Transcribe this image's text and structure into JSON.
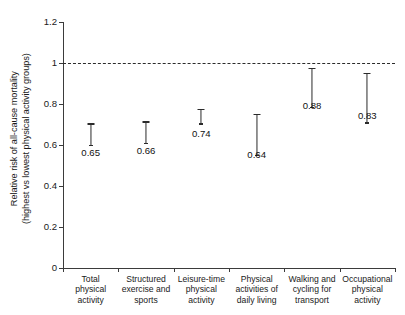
{
  "chart_data": {
    "type": "bar",
    "title": "",
    "xlabel": "",
    "ylabel_line1": "Relative risk of all-cause mortality",
    "ylabel_line2": "(highest vs lowest physical activity groups)",
    "ylim": [
      0,
      1.2
    ],
    "yticks": [
      "0",
      "0.2",
      "0.4",
      "0.6",
      "0.8",
      "1",
      "1.2"
    ],
    "ytick_values": [
      0,
      0.2,
      0.4,
      0.6,
      0.8,
      1,
      1.2
    ],
    "grid": false,
    "legend": "none",
    "reference_line": {
      "value": 1.0,
      "style": "dashed",
      "label": ""
    },
    "categories": [
      "Total physical activity",
      "Structured exercise and sports",
      "Leisure-time physical activity",
      "Physical activities of daily living",
      "Walking and cycling for transport",
      "Occupational physical activity"
    ],
    "category_lines": [
      [
        "Total",
        "physical",
        "activity"
      ],
      [
        "Structured",
        "exercise and",
        "sports"
      ],
      [
        "Leisure-time",
        "physical",
        "activity"
      ],
      [
        "Physical",
        "activities of",
        "daily living"
      ],
      [
        "Walking and",
        "cycling for",
        "transport"
      ],
      [
        "Occupational",
        "physical",
        "activity"
      ]
    ],
    "values": [
      0.65,
      0.66,
      0.74,
      0.64,
      0.88,
      0.83
    ],
    "value_labels": [
      "0.65",
      "0.66",
      "0.74",
      "0.64",
      "0.88",
      "0.83"
    ],
    "error_low": [
      0.6,
      0.61,
      0.705,
      0.55,
      0.785,
      0.71
    ],
    "error_high": [
      0.705,
      0.715,
      0.775,
      0.75,
      0.975,
      0.95
    ],
    "bar_fill": "#ffffff",
    "bar_edge": "#3b3b3b",
    "error_color": "#2b2b2b"
  }
}
